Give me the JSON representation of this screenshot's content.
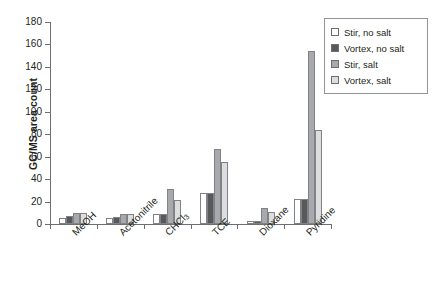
{
  "chart_data": {
    "type": "bar",
    "title": "",
    "xlabel": "",
    "ylabel": "GC/MS area count",
    "ylim": [
      0,
      180
    ],
    "ytick_step": 20,
    "yticks": [
      0,
      20,
      40,
      60,
      80,
      100,
      120,
      140,
      160,
      180
    ],
    "grid": false,
    "legend_position": "top-right",
    "categories": [
      "MeOH",
      "Acetonitrile",
      "CHCl3",
      "TCE",
      "Dioxane",
      "Pyridine"
    ],
    "category_labels_html": [
      "MeOH",
      "Acetonitrile",
      "CHCl<sub>3</sub>",
      "TCE",
      "Dioxane",
      "Pyridine"
    ],
    "series": [
      {
        "name": "Stir, no salt",
        "color": "#ffffff",
        "values": [
          5,
          5,
          9,
          28,
          3,
          22
        ]
      },
      {
        "name": "Vortex, no salt",
        "color": "#58595b",
        "values": [
          7,
          6,
          9,
          28,
          3,
          22
        ]
      },
      {
        "name": "Stir, salt",
        "color": "#a7a9ac",
        "values": [
          10,
          9,
          31,
          67,
          14,
          154
        ]
      },
      {
        "name": "Vortex, salt",
        "color": "#dcdddf",
        "values": [
          10,
          9,
          21,
          55,
          11,
          84
        ]
      }
    ]
  },
  "legend": {
    "items": [
      {
        "label": "Stir, no salt"
      },
      {
        "label": "Vortex, no salt"
      },
      {
        "label": "Stir, salt"
      },
      {
        "label": "Vortex, salt"
      }
    ]
  },
  "axes": {
    "y_title": "GC/MS area count"
  },
  "colors": {
    "axis": "#6d6e71",
    "text": "#231f20",
    "bar_border": "#808285",
    "series_0": "#ffffff",
    "series_1": "#58595b",
    "series_2": "#a7a9ac",
    "series_3": "#dcdddf"
  }
}
